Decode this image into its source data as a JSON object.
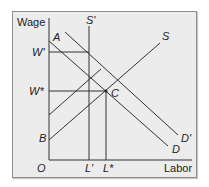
{
  "diagram": {
    "y_axis_label": "Wage",
    "x_axis_label": "Labor",
    "origin_label": "O",
    "y_ticks": [
      {
        "label": "W'",
        "name": "w-prime"
      },
      {
        "label": "W*",
        "name": "w-star"
      },
      {
        "label": "B",
        "name": "b"
      }
    ],
    "x_ticks": [
      {
        "label": "L'",
        "name": "l-prime"
      },
      {
        "label": "L*",
        "name": "l-star"
      }
    ],
    "curves": {
      "demand": "D",
      "demand_shifted": "D'",
      "supply": "S",
      "supply_vertical": "S'"
    },
    "points": {
      "a": "A",
      "c": "C"
    },
    "colors": {
      "background": "#ececec",
      "line": "#333333",
      "border": "#8e8e8e"
    }
  }
}
